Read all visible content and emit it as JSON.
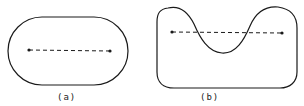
{
  "figures": [
    {
      "id": "a",
      "label": "(a)",
      "shape": "convex stadium",
      "points": 2,
      "segment": "dashed, fully inside"
    },
    {
      "id": "b",
      "label": "(b)",
      "shape": "non-convex notched",
      "points": 2,
      "segment": "dashed, exits shape"
    }
  ],
  "colors": {
    "stroke": "#1a1a1a",
    "background": "#ffffff"
  }
}
